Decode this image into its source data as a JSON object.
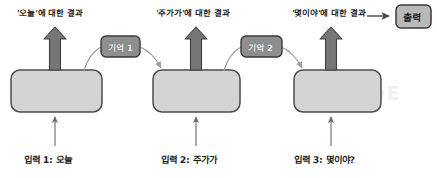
{
  "diagram": {
    "title_cut": "",
    "steps": [
      {
        "result_label": "'오늘'에 대한 결과",
        "input_label": "입력 1: 오늘",
        "cell_name": "rnn-cell-1"
      },
      {
        "result_label": "'주가가'에 대한 결과",
        "input_label": "입력 2: 주가가",
        "cell_name": "rnn-cell-2"
      },
      {
        "result_label": "'몇이야'에 대한 결과",
        "input_label": "입력 3: 몇이야?",
        "cell_name": "rnn-cell-3"
      }
    ],
    "memories": [
      {
        "label": "기억 1"
      },
      {
        "label": "기억 2"
      }
    ],
    "output": {
      "label": "출력"
    },
    "watermark": "GUIDE",
    "colors": {
      "cell_fill": "#d4d4d4",
      "cell_stroke": "#4c4c4c",
      "memory_fill": "#8e8e8e",
      "memory_stroke": "#3b3b3b",
      "output_fill": "#b9b9b9",
      "output_stroke": "#3b3b3b",
      "up_arrow": "#767676",
      "thin_arrow": "#6a6a6a",
      "curve": "#9c9c9c",
      "text": "#1d1d1d"
    }
  }
}
